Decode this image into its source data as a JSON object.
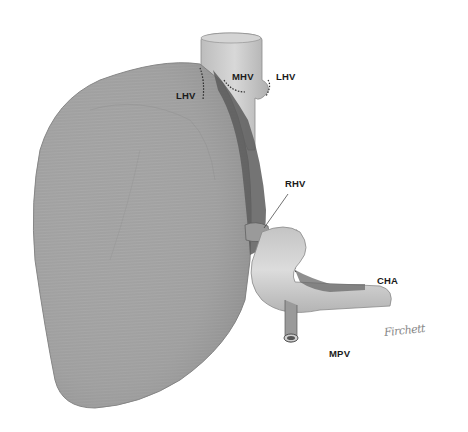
{
  "figure": {
    "background": "#ffffff",
    "colors": {
      "liver_fill": "#a9a9a9",
      "liver_dark": "#6e6e6e",
      "vessel_fill": "#c8c8c8",
      "ivc_dark": "#4a4a4a",
      "label": "#1a1a1a"
    }
  },
  "labels": {
    "lhv_left": "LHV",
    "mhv": "MHV",
    "lhv_right": "LHV",
    "rhv": "RHV",
    "cha": "CHA",
    "mpv": "MPV"
  },
  "signature": "Firchett"
}
